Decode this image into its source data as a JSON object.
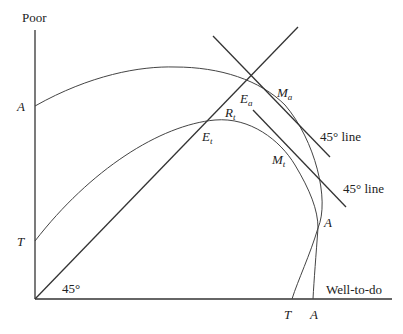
{
  "axes": {
    "y_label": "Poor",
    "x_label": "Well-to-do",
    "angle_label": "45°"
  },
  "axis_ticks": {
    "y_A": "A",
    "y_T": "T",
    "x_T": "T",
    "x_A": "A"
  },
  "points": {
    "Ea": {
      "main": "E",
      "sub": "a"
    },
    "Ma": {
      "main": "M",
      "sub": "a"
    },
    "Rt": {
      "main": "R",
      "sub": "t"
    },
    "Et": {
      "main": "E",
      "sub": "t"
    },
    "Mt": {
      "main": "M",
      "sub": "t"
    },
    "A": "A"
  },
  "lines": {
    "upper_tangent_label": "45° line",
    "lower_tangent_label": "45° line"
  },
  "curves": [
    {
      "name": "A-A frontier",
      "endpoints": [
        "A on Poor axis",
        "A on Well-to-do axis"
      ]
    },
    {
      "name": "T-T frontier",
      "endpoints": [
        "T on Poor axis",
        "T on Well-to-do axis"
      ]
    }
  ]
}
